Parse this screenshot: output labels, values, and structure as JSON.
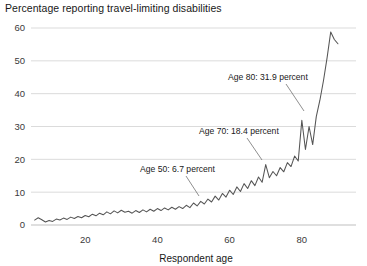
{
  "chart_data": {
    "type": "line",
    "title": "Percentage reporting travel-limiting disabilities",
    "xlabel": "Respondent age",
    "ylabel": "",
    "xlim": [
      5,
      95
    ],
    "ylim": [
      0,
      62
    ],
    "xticks": [
      20,
      40,
      60,
      80
    ],
    "yticks": [
      0,
      10,
      20,
      30,
      40,
      50,
      60
    ],
    "grid": true,
    "legend": null,
    "series_name": "Percentage reporting travel-limiting disabilities",
    "line_color": "#555555",
    "grid_color": "#d2d2d2",
    "annotations": [
      {
        "text": "Age 50: 6.7 percent",
        "age": 50,
        "value": 6.7,
        "text_x": 140,
        "text_y": 172,
        "leader": [
          [
            186,
            176
          ],
          [
            199,
            196
          ]
        ]
      },
      {
        "text": "Age 70: 18.4 percent",
        "age": 70,
        "value": 18.4,
        "text_x": 199,
        "text_y": 134,
        "leader": [
          [
            247,
            138
          ],
          [
            262,
            160
          ]
        ]
      },
      {
        "text": "Age 80: 31.9 percent",
        "age": 80,
        "value": 31.9,
        "text_x": 228,
        "text_y": 80,
        "leader": [
          [
            286,
            84
          ],
          [
            304,
            111
          ]
        ]
      }
    ],
    "x": [
      6,
      7,
      8,
      9,
      10,
      11,
      12,
      13,
      14,
      15,
      16,
      17,
      18,
      19,
      20,
      21,
      22,
      23,
      24,
      25,
      26,
      27,
      28,
      29,
      30,
      31,
      32,
      33,
      34,
      35,
      36,
      37,
      38,
      39,
      40,
      41,
      42,
      43,
      44,
      45,
      46,
      47,
      48,
      49,
      50,
      51,
      52,
      53,
      54,
      55,
      56,
      57,
      58,
      59,
      60,
      61,
      62,
      63,
      64,
      65,
      66,
      67,
      68,
      69,
      70,
      71,
      72,
      73,
      74,
      75,
      76,
      77,
      78,
      79,
      80,
      81,
      82,
      83,
      84,
      85,
      86,
      87,
      88,
      89,
      90
    ],
    "values": [
      1.5,
      2.2,
      1.6,
      0.9,
      1.4,
      1.1,
      1.8,
      1.5,
      2.1,
      1.7,
      2.4,
      2.0,
      2.6,
      2.2,
      2.9,
      2.5,
      3.3,
      2.8,
      3.6,
      3.1,
      4.0,
      3.4,
      4.3,
      3.7,
      4.5,
      3.9,
      4.2,
      3.6,
      4.4,
      3.8,
      4.6,
      4.0,
      4.8,
      4.2,
      5.0,
      4.4,
      5.2,
      4.6,
      5.4,
      4.8,
      5.6,
      5.0,
      6.0,
      5.3,
      6.7,
      5.8,
      7.2,
      6.4,
      7.9,
      7.0,
      8.8,
      7.6,
      9.6,
      8.5,
      10.6,
      9.3,
      11.6,
      10.2,
      12.6,
      11.1,
      13.5,
      12.0,
      14.6,
      13.0,
      18.4,
      14.4,
      16.3,
      15.0,
      17.5,
      16.2,
      19.0,
      17.8,
      21.0,
      19.5,
      31.9,
      23.0,
      30.0,
      24.5,
      33.0,
      38.0,
      44.0,
      51.0,
      58.8,
      56.5,
      55.2
    ]
  }
}
